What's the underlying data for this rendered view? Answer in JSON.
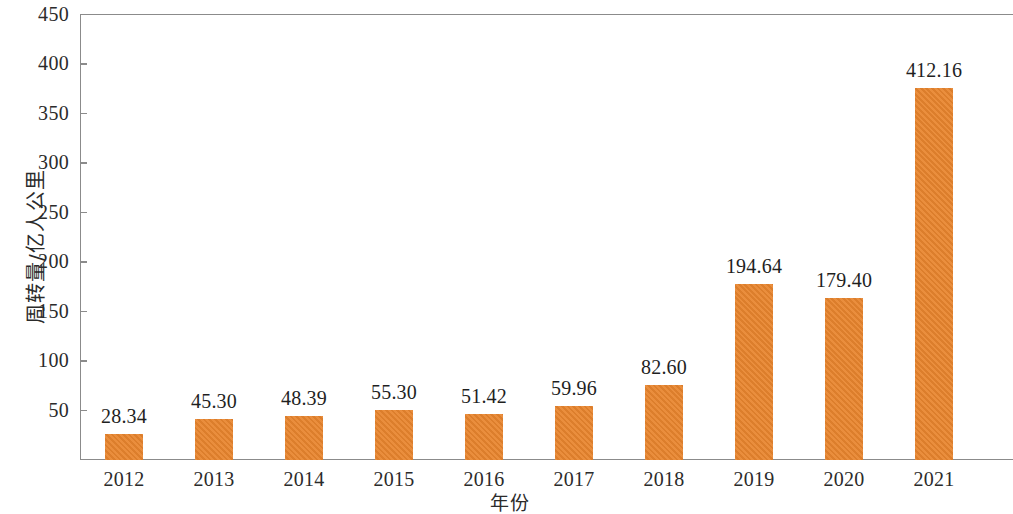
{
  "chart_data": {
    "type": "bar",
    "title": "",
    "subtitle": "",
    "xlabel": "年份",
    "ylabel": "周转量/亿人公里",
    "categories": [
      "2012",
      "2013",
      "2014",
      "2015",
      "2016",
      "2017",
      "2018",
      "2019",
      "2020",
      "2021"
    ],
    "values": [
      28.34,
      45.3,
      48.39,
      55.3,
      51.42,
      59.96,
      82.6,
      194.64,
      179.4,
      412.16
    ],
    "value_labels": [
      "28.34",
      "45.30",
      "48.39",
      "55.30",
      "51.42",
      "59.96",
      "82.60",
      "194.64",
      "179.40",
      "412.16"
    ],
    "ylim": [
      0,
      450
    ],
    "y_ticks": [
      50,
      100,
      150,
      200,
      250,
      300,
      350,
      400,
      450
    ],
    "y_tick_labels": [
      "50",
      "100",
      "150",
      "200",
      "250",
      "300",
      "350",
      "400",
      "450"
    ],
    "grid": false,
    "legend": null,
    "legend_position": "none",
    "series": [
      {
        "name": "周转量",
        "values": [
          28.34,
          45.3,
          48.39,
          55.3,
          51.42,
          59.96,
          82.6,
          194.64,
          179.4,
          412.16
        ],
        "color": "#e8852e"
      }
    ],
    "colors": {
      "bar": "#e8852e",
      "axis": "#8b8b8b",
      "text": "#2b2b2b",
      "background": "#ffffff"
    }
  }
}
